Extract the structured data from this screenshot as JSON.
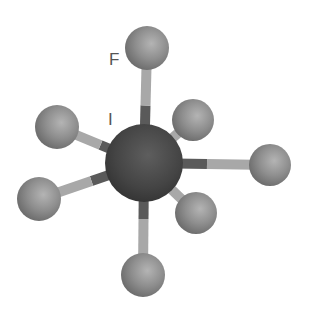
{
  "diagram": {
    "labels": {
      "fluorine": "F",
      "iodine": "I"
    },
    "central_atom": {
      "element": "I",
      "cx": 144,
      "cy": 163,
      "r": 39,
      "color": "#4a4a4a"
    },
    "ligand_color": "#8c8c8c",
    "bond_light_color": "#a8a8a8",
    "bond_dark_color": "#5a5a5a",
    "ligands": [
      {
        "id": "top",
        "element": "F",
        "cx": 147,
        "cy": 48,
        "r": 22
      },
      {
        "id": "upper-right",
        "element": "F",
        "cx": 193,
        "cy": 120,
        "r": 21
      },
      {
        "id": "upper-left",
        "element": "F",
        "cx": 57,
        "cy": 127,
        "r": 22
      },
      {
        "id": "right",
        "element": "F",
        "cx": 270,
        "cy": 165,
        "r": 21
      },
      {
        "id": "lower-left",
        "element": "F",
        "cx": 39,
        "cy": 199,
        "r": 22
      },
      {
        "id": "lower-right",
        "element": "F",
        "cx": 196,
        "cy": 213,
        "r": 21
      },
      {
        "id": "bottom",
        "element": "F",
        "cx": 143,
        "cy": 275,
        "r": 22
      }
    ]
  }
}
